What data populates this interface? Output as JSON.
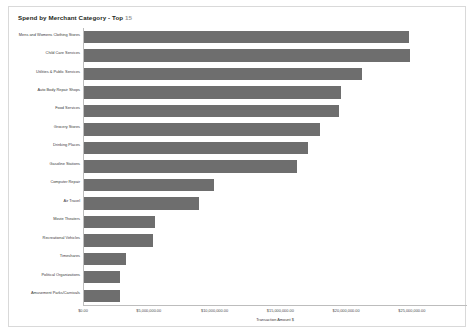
{
  "panel": {
    "title_main": "Spend by Merchant Category - Top",
    "title_count": "15"
  },
  "colors": {
    "bar": "#6e6e6e",
    "panel_border": "#d9d9d9",
    "axis": "#bdbdbd",
    "title_text": "#231f20",
    "count_text": "#9a9a9a",
    "label_text": "#3a3a3a",
    "background": "#ffffff"
  },
  "chart_data": {
    "type": "bar",
    "orientation": "horizontal",
    "title": "Spend by Merchant Category - Top 15",
    "xlabel": "Transaction Amount $",
    "ylabel": "",
    "grid": false,
    "legend": null,
    "xlim": [
      0,
      26300000
    ],
    "xticks": [
      0,
      5000000,
      10000000,
      15000000,
      20000000,
      25000000
    ],
    "xtick_labels": [
      "$0.00",
      "$5,000,000.00",
      "$10,000,000.00",
      "$15,000,000.00",
      "$20,000,000.00",
      "$25,000,000.00"
    ],
    "categories": [
      "Mens and Womens Clothing Stores",
      "Child Care Services",
      "Utilities & Public Services",
      "Auto Body Repair Shops",
      "Food Services",
      "Grocery Stores",
      "Drinking Places",
      "Gasoline Stations",
      "Computer Repair",
      "Air Travel",
      "Movie Theaters",
      "Recreational Vehicles",
      "Timeshares",
      "Political Organizations",
      "Amusement Parks/Carnivals"
    ],
    "values": [
      24700000,
      24750000,
      21150000,
      19500000,
      19350000,
      17950000,
      16990000,
      16160000,
      9860000,
      8770000,
      5410000,
      5280000,
      3220000,
      2740000,
      2740000
    ],
    "value_labels": [
      "$24,700,000.00",
      "$24,750,000.00",
      "$21,150,000.00",
      "$19,500,000.00",
      "$19,350,000.00",
      "$17,950,000.00",
      "$16,990,000.00",
      "$16,160,000.00",
      "$9,860,000.00",
      "$8,770,000.00",
      "$5,410,000.00",
      "$5,280,000.00",
      "$3,220,000.00",
      "$2,740,000.00",
      "$2,740,000.00"
    ]
  }
}
